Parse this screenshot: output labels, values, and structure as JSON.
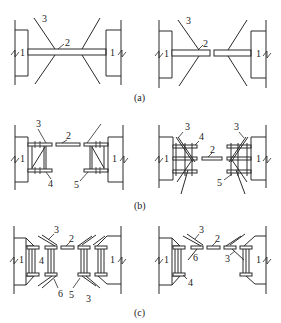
{
  "figure": {
    "panels": [
      {
        "id": "a",
        "caption": "(a)",
        "left": {
          "labels": {
            "wall": "1",
            "beam": "2",
            "brace": "3"
          }
        },
        "right": {
          "labels": {
            "wall": "1",
            "beam": "2",
            "brace": "3"
          }
        }
      },
      {
        "id": "b",
        "caption": "(b)",
        "left": {
          "labels": {
            "wall": "1",
            "beam": "2",
            "brace": "3",
            "bracket": "4",
            "support": "5"
          }
        },
        "right": {
          "labels": {
            "wall": "1",
            "beam": "2",
            "brace": "3",
            "bracket": "4",
            "support": "5"
          }
        }
      },
      {
        "id": "c",
        "caption": "(c)",
        "left": {
          "labels": {
            "wall": "1",
            "beam": "2",
            "brace_top": "3",
            "bracket": "4",
            "support": "5",
            "connector": "6",
            "brace_bottom": "3"
          }
        },
        "right": {
          "labels": {
            "wall": "1",
            "beam": "2",
            "brace_top": "3",
            "bracket": "4",
            "connector": "6",
            "brace_bottom": "3"
          }
        }
      }
    ]
  },
  "colors": {
    "line": "#2a2a2a",
    "background": "#ffffff",
    "text": "#222222"
  }
}
